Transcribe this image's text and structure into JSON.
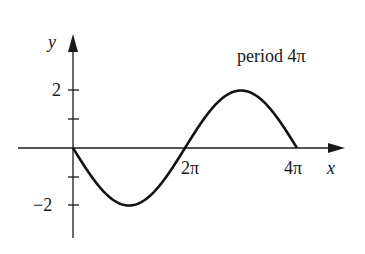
{
  "chart_data": {
    "type": "line",
    "title": "",
    "annotation": "period 4π",
    "xlabel": "x",
    "ylabel": "y",
    "function": "y = -2 sin(x/2)",
    "x_ticks": [
      {
        "value": 6.2832,
        "label": "2π"
      },
      {
        "value": 12.5664,
        "label": "4π"
      }
    ],
    "y_ticks": [
      {
        "value": 2,
        "label": "2"
      },
      {
        "value": 1,
        "label": ""
      },
      {
        "value": -1,
        "label": ""
      },
      {
        "value": -2,
        "label": "−2"
      }
    ],
    "x": [
      0,
      1.5708,
      3.1416,
      4.7124,
      6.2832,
      7.854,
      9.4248,
      10.9956,
      12.5664
    ],
    "values": [
      0,
      -1.414,
      -2,
      -1.414,
      0,
      1.414,
      2,
      1.414,
      0
    ],
    "xlim": [
      0,
      12.5664
    ],
    "ylim": [
      -2.5,
      2.5
    ],
    "grid": false,
    "legend": "none"
  },
  "labels": {
    "y_axis": "y",
    "x_axis": "x",
    "period": "period 4π",
    "tick_2pi": "2π",
    "tick_4pi": "4π",
    "tick_y2": "2",
    "tick_yneg2": "−2"
  }
}
